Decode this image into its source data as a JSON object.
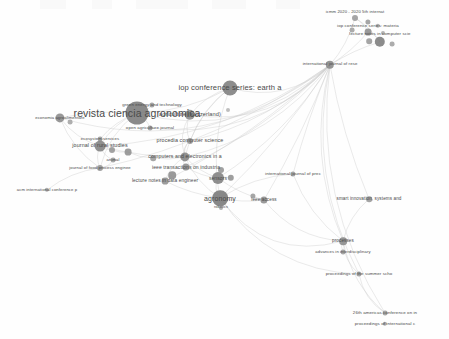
{
  "view": {
    "title": "bibliometric co-citation source network map",
    "width": 449,
    "height": 339,
    "background_color": "#ffffff",
    "node_color": "#8f8f8f",
    "edge_color": "#c9c9c9",
    "label_color": "#4a4a4a"
  },
  "chart_data": {
    "type": "scatter",
    "title": "",
    "xlabel": "",
    "ylabel": "",
    "grid": false,
    "legend": "none",
    "xlim": [
      0,
      449
    ],
    "ylim": [
      0,
      339
    ],
    "nodes": [
      {
        "label": "icmm 2020 - 2020 5th internat",
        "x": 355,
        "y": 18,
        "r": 3.0,
        "label_dx": 0,
        "label_dy": -6,
        "font": 4.2,
        "shade": "#9a9a9a"
      },
      {
        "label": "",
        "x": 368,
        "y": 22,
        "r": 2.6,
        "label_dx": 0,
        "label_dy": 0,
        "font": 4.2,
        "shade": "#9a9a9a"
      },
      {
        "label": "",
        "x": 378,
        "y": 26,
        "r": 2.2,
        "label_dx": 0,
        "label_dy": 0,
        "font": 4.2,
        "shade": "#a5a5a5"
      },
      {
        "label": "iop conference series: materia",
        "x": 368,
        "y": 32,
        "r": 3.4,
        "label_dx": 0,
        "label_dy": -6,
        "font": 4.4,
        "shade": "#8c8c8c"
      },
      {
        "label": "",
        "x": 352,
        "y": 30,
        "r": 2.4,
        "label_dx": 0,
        "label_dy": 0,
        "font": 4.2,
        "shade": "#a0a0a0"
      },
      {
        "label": "",
        "x": 383,
        "y": 33,
        "r": 2.0,
        "label_dx": 0,
        "label_dy": 0,
        "font": 4.2,
        "shade": "#a8a8a8"
      },
      {
        "label": "lecture notes in computer scie",
        "x": 380,
        "y": 42,
        "r": 5.2,
        "label_dx": 0,
        "label_dy": -8,
        "font": 4.4,
        "shade": "#7c7c7c"
      },
      {
        "label": "",
        "x": 369,
        "y": 41,
        "r": 2.8,
        "label_dx": 0,
        "label_dy": 0,
        "font": 4.2,
        "shade": "#999999"
      },
      {
        "label": "",
        "x": 392,
        "y": 44,
        "r": 2.4,
        "label_dx": 0,
        "label_dy": 0,
        "font": 4.2,
        "shade": "#a0a0a0"
      },
      {
        "label": "international journal of rese",
        "x": 330,
        "y": 65,
        "r": 4.2,
        "label_dx": 0,
        "label_dy": -1,
        "font": 4.3,
        "shade": "#878787"
      },
      {
        "label": "iop conference series: earth a",
        "x": 230,
        "y": 88,
        "r": 7.5,
        "label_dx": 0,
        "label_dy": 0,
        "font": 7.6,
        "shade": "#7d7d7d"
      },
      {
        "label": "green energy and technology",
        "x": 152,
        "y": 105,
        "r": 2.6,
        "label_dx": 0,
        "label_dy": 0,
        "font": 4.4,
        "shade": "#999999"
      },
      {
        "label": "revista ciencia agronomica",
        "x": 137,
        "y": 113,
        "r": 11.5,
        "label_dx": 0,
        "label_dy": 0,
        "font": 10.5,
        "shade": "#7a7a7a"
      },
      {
        "label": "agriculture (switzerland)",
        "x": 190,
        "y": 115,
        "r": 5.2,
        "label_dx": 0,
        "label_dy": 0,
        "font": 5.6,
        "shade": "#8a8a8a"
      },
      {
        "label": "",
        "x": 228,
        "y": 110,
        "r": 2.0,
        "label_dx": 0,
        "label_dy": 0,
        "font": 4.0,
        "shade": "#b5b5b5"
      },
      {
        "label": "economia agroalimentare",
        "x": 60,
        "y": 118,
        "r": 4.6,
        "label_dx": 0,
        "label_dy": 0,
        "font": 4.2,
        "shade": "#8a8a8a"
      },
      {
        "label": "",
        "x": 70,
        "y": 122,
        "r": 2.4,
        "label_dx": 0,
        "label_dy": 0,
        "font": 4.0,
        "shade": "#a4a4a4"
      },
      {
        "label": "open agriculture journal",
        "x": 150,
        "y": 128,
        "r": 2.4,
        "label_dx": 0,
        "label_dy": 0,
        "font": 4.4,
        "shade": "#9c9c9c"
      },
      {
        "label": "ecosystem services",
        "x": 100,
        "y": 139,
        "r": 2.4,
        "label_dx": 0,
        "label_dy": 0,
        "font": 4.2,
        "shade": "#9c9c9c"
      },
      {
        "label": "procedia computer science",
        "x": 190,
        "y": 141,
        "r": 3.0,
        "label_dx": 0,
        "label_dy": 0,
        "font": 5.4,
        "shade": "#949494"
      },
      {
        "label": "journal of rural studies",
        "x": 100,
        "y": 146,
        "r": 5.4,
        "label_dx": 0,
        "label_dy": 0,
        "font": 5.4,
        "shade": "#818181"
      },
      {
        "label": "",
        "x": 112,
        "y": 150,
        "r": 3.0,
        "label_dx": 0,
        "label_dy": 0,
        "font": 4.0,
        "shade": "#959595"
      },
      {
        "label": "",
        "x": 128,
        "y": 152,
        "r": 3.4,
        "label_dx": 0,
        "label_dy": 0,
        "font": 4.0,
        "shade": "#909090"
      },
      {
        "label": "animal",
        "x": 113,
        "y": 160,
        "r": 2.4,
        "label_dx": 0,
        "label_dy": 0,
        "font": 4.2,
        "shade": "#9c9c9c"
      },
      {
        "label": "computers and electronics in a",
        "x": 185,
        "y": 157,
        "r": 4.6,
        "label_dx": 0,
        "label_dy": 0,
        "font": 5.2,
        "shade": "#848484"
      },
      {
        "label": "",
        "x": 153,
        "y": 158,
        "r": 2.8,
        "label_dx": 0,
        "label_dy": 0,
        "font": 4.0,
        "shade": "#9a9a9a"
      },
      {
        "label": "journal of food process enginee",
        "x": 100,
        "y": 168,
        "r": 3.0,
        "label_dx": 0,
        "label_dy": 0,
        "font": 4.2,
        "shade": "#949494"
      },
      {
        "label": "ieee transactions on industria",
        "x": 186,
        "y": 167,
        "r": 3.6,
        "label_dx": 0,
        "label_dy": 0,
        "font": 5.0,
        "shade": "#8c8c8c"
      },
      {
        "label": "",
        "x": 221,
        "y": 170,
        "r": 3.0,
        "label_dx": 0,
        "label_dy": 0,
        "font": 4.0,
        "shade": "#949494"
      },
      {
        "label": "sensors",
        "x": 218,
        "y": 178,
        "r": 6.0,
        "label_dx": 0,
        "label_dy": 0,
        "font": 5.0,
        "shade": "#7f7f7f"
      },
      {
        "label": "",
        "x": 231,
        "y": 178,
        "r": 3.2,
        "label_dx": 0,
        "label_dy": 0,
        "font": 4.0,
        "shade": "#929292"
      },
      {
        "label": "lecture notes in data engineer",
        "x": 165,
        "y": 181,
        "r": 3.4,
        "label_dx": 0,
        "label_dy": 0,
        "font": 4.8,
        "shade": "#8e8e8e"
      },
      {
        "label": "",
        "x": 172,
        "y": 175,
        "r": 3.8,
        "label_dx": 0,
        "label_dy": 0,
        "font": 4.0,
        "shade": "#8c8c8c"
      },
      {
        "label": "acm international conference p",
        "x": 47,
        "y": 190,
        "r": 2.2,
        "label_dx": 0,
        "label_dy": 0,
        "font": 4.2,
        "shade": "#a2a2a2"
      },
      {
        "label": "international journal of prec",
        "x": 293,
        "y": 174,
        "r": 2.6,
        "label_dx": 0,
        "label_dy": 0,
        "font": 4.4,
        "shade": "#9a9a9a"
      },
      {
        "label": "agronomy",
        "x": 220,
        "y": 198,
        "r": 7.8,
        "label_dx": 0,
        "label_dy": 0,
        "font": 7.0,
        "shade": "#787878"
      },
      {
        "label": "robotics",
        "x": 221,
        "y": 208,
        "r": 2.0,
        "label_dx": 0,
        "label_dy": 0,
        "font": 3.8,
        "shade": "#a6a6a6"
      },
      {
        "label": "ieee access",
        "x": 264,
        "y": 200,
        "r": 3.6,
        "label_dx": 0,
        "label_dy": 0,
        "font": 4.6,
        "shade": "#8c8c8c"
      },
      {
        "label": "",
        "x": 253,
        "y": 196,
        "r": 2.6,
        "label_dx": 0,
        "label_dy": 0,
        "font": 4.0,
        "shade": "#9a9a9a"
      },
      {
        "label": "smart innovation, systems and",
        "x": 369,
        "y": 199,
        "r": 2.8,
        "label_dx": 0,
        "label_dy": 0,
        "font": 4.6,
        "shade": "#979797"
      },
      {
        "label": "processes",
        "x": 343,
        "y": 241,
        "r": 3.8,
        "label_dx": 0,
        "label_dy": 0,
        "font": 4.6,
        "shade": "#8a8a8a"
      },
      {
        "label": "advances in interdisciplinary",
        "x": 343,
        "y": 252,
        "r": 2.4,
        "label_dx": 0,
        "label_dy": 0,
        "font": 4.2,
        "shade": "#9c9c9c"
      },
      {
        "label": "proceedings of the summer scho",
        "x": 359,
        "y": 274,
        "r": 2.6,
        "label_dx": 0,
        "label_dy": 0,
        "font": 4.4,
        "shade": "#9a9a9a"
      },
      {
        "label": "26th americas conference on in",
        "x": 385,
        "y": 313,
        "r": 2.4,
        "label_dx": 0,
        "label_dy": 0,
        "font": 4.4,
        "shade": "#9c9c9c"
      },
      {
        "label": "proceedings of international c",
        "x": 385,
        "y": 324,
        "r": 2.2,
        "label_dx": 0,
        "label_dy": 0,
        "font": 4.4,
        "shade": "#a0a0a0"
      }
    ],
    "edges": [
      {
        "from": 9,
        "to": 10,
        "curve": -28
      },
      {
        "from": 9,
        "to": 12,
        "curve": -55
      },
      {
        "from": 9,
        "to": 15,
        "curve": -70
      },
      {
        "from": 9,
        "to": 13,
        "curve": -40
      },
      {
        "from": 9,
        "to": 24,
        "curve": -30
      },
      {
        "from": 9,
        "to": 29,
        "curve": -18
      },
      {
        "from": 9,
        "to": 35,
        "curve": -10
      },
      {
        "from": 9,
        "to": 37,
        "curve": -6
      },
      {
        "from": 9,
        "to": 34,
        "curve": 4
      },
      {
        "from": 9,
        "to": 39,
        "curve": 8
      },
      {
        "from": 9,
        "to": 40,
        "curve": 30
      },
      {
        "from": 9,
        "to": 42,
        "curve": 38
      },
      {
        "from": 9,
        "to": 43,
        "curve": 46
      },
      {
        "from": 9,
        "to": 6,
        "curve": -4
      },
      {
        "from": 9,
        "to": 3,
        "curve": 4
      },
      {
        "from": 9,
        "to": 0,
        "curve": 6
      },
      {
        "from": 9,
        "to": 19,
        "curve": -22
      },
      {
        "from": 9,
        "to": 27,
        "curve": -16
      },
      {
        "from": 9,
        "to": 31,
        "curve": -14
      },
      {
        "from": 10,
        "to": 12,
        "curve": -12
      },
      {
        "from": 10,
        "to": 13,
        "curve": 8
      },
      {
        "from": 10,
        "to": 19,
        "curve": 10
      },
      {
        "from": 10,
        "to": 24,
        "curve": 14
      },
      {
        "from": 10,
        "to": 35,
        "curve": 16
      },
      {
        "from": 12,
        "to": 15,
        "curve": 6
      },
      {
        "from": 12,
        "to": 11,
        "curve": 4
      },
      {
        "from": 12,
        "to": 17,
        "curve": -4
      },
      {
        "from": 12,
        "to": 20,
        "curve": 8
      },
      {
        "from": 12,
        "to": 13,
        "curve": -5
      },
      {
        "from": 12,
        "to": 18,
        "curve": 6
      },
      {
        "from": 12,
        "to": 26,
        "curve": 12
      },
      {
        "from": 15,
        "to": 20,
        "curve": 8
      },
      {
        "from": 15,
        "to": 26,
        "curve": 10
      },
      {
        "from": 20,
        "to": 24,
        "curve": 6
      },
      {
        "from": 20,
        "to": 26,
        "curve": 5
      },
      {
        "from": 20,
        "to": 23,
        "curve": 4
      },
      {
        "from": 24,
        "to": 27,
        "curve": 4
      },
      {
        "from": 24,
        "to": 29,
        "curve": 5
      },
      {
        "from": 24,
        "to": 31,
        "curve": 6
      },
      {
        "from": 24,
        "to": 35,
        "curve": 8
      },
      {
        "from": 24,
        "to": 19,
        "curve": -6
      },
      {
        "from": 27,
        "to": 29,
        "curve": 4
      },
      {
        "from": 29,
        "to": 35,
        "curve": 6
      },
      {
        "from": 29,
        "to": 37,
        "curve": 5
      },
      {
        "from": 31,
        "to": 35,
        "curve": 5
      },
      {
        "from": 35,
        "to": 37,
        "curve": 4
      },
      {
        "from": 35,
        "to": 40,
        "curve": 45
      },
      {
        "from": 35,
        "to": 42,
        "curve": 40
      },
      {
        "from": 37,
        "to": 40,
        "curve": 20
      },
      {
        "from": 39,
        "to": 40,
        "curve": 8
      },
      {
        "from": 40,
        "to": 42,
        "curve": 8
      },
      {
        "from": 40,
        "to": 41,
        "curve": 3
      },
      {
        "from": 42,
        "to": 43,
        "curve": 10
      },
      {
        "from": 40,
        "to": 43,
        "curve": 14
      },
      {
        "from": 6,
        "to": 3,
        "curve": 3
      },
      {
        "from": 6,
        "to": 0,
        "curve": 4
      },
      {
        "from": 3,
        "to": 0,
        "curve": 3
      },
      {
        "from": 13,
        "to": 19,
        "curve": 6
      },
      {
        "from": 13,
        "to": 24,
        "curve": 10
      },
      {
        "from": 19,
        "to": 24,
        "curve": 5
      },
      {
        "from": 34,
        "to": 35,
        "curve": 10
      },
      {
        "from": 34,
        "to": 40,
        "curve": 12
      },
      {
        "from": 33,
        "to": 26,
        "curve": -8
      },
      {
        "from": 26,
        "to": 23,
        "curve": 4
      },
      {
        "from": 20,
        "to": 21,
        "curve": 2
      },
      {
        "from": 21,
        "to": 22,
        "curve": 2
      },
      {
        "from": 22,
        "to": 25,
        "curve": 3
      },
      {
        "from": 25,
        "to": 24,
        "curve": 3
      },
      {
        "from": 30,
        "to": 29,
        "curve": 2
      },
      {
        "from": 32,
        "to": 31,
        "curve": 2
      },
      {
        "from": 38,
        "to": 37,
        "curve": 2
      },
      {
        "from": 9,
        "to": 17,
        "curve": -48
      },
      {
        "from": 9,
        "to": 20,
        "curve": -35
      },
      {
        "from": 9,
        "to": 26,
        "curve": -26
      }
    ]
  },
  "artifacts": [
    {
      "x": 40,
      "w": 26
    },
    {
      "x": 92,
      "w": 20
    },
    {
      "x": 136,
      "w": 52
    },
    {
      "x": 212,
      "w": 34
    },
    {
      "x": 276,
      "w": 24
    }
  ]
}
